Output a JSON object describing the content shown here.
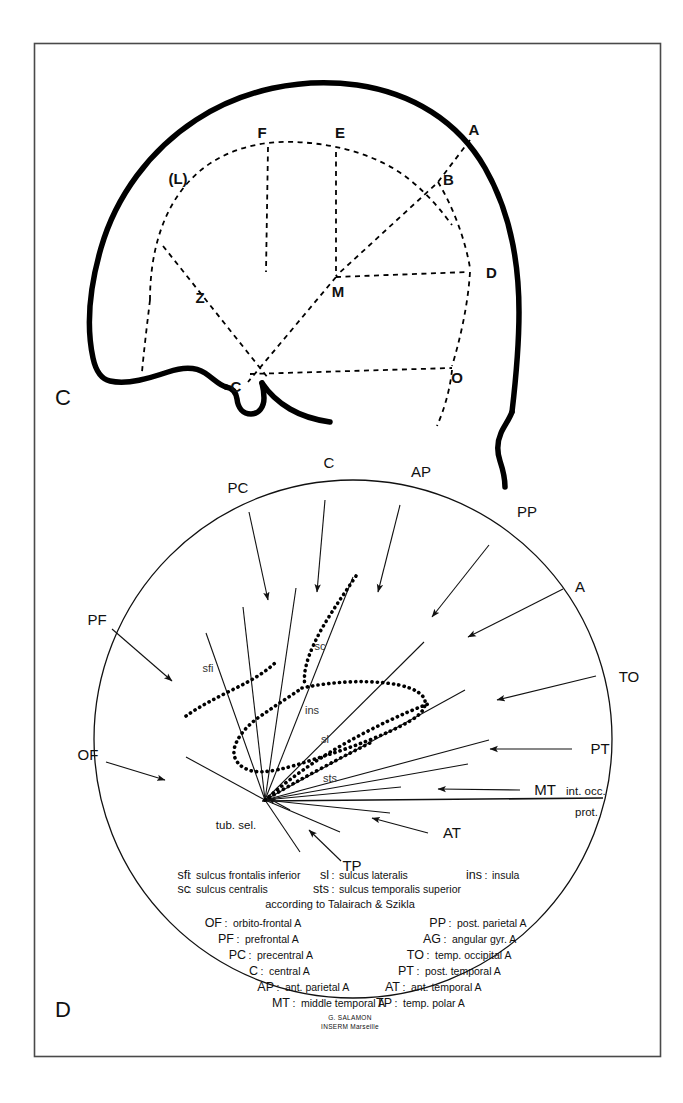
{
  "figure": {
    "panels": [
      {
        "id": "C",
        "label": "C",
        "caption_role": "lateral-skull-landmark-diagram"
      },
      {
        "id": "D",
        "label": "D",
        "caption_role": "circular-angiographic-reference-diagram"
      }
    ]
  },
  "panel_c": {
    "label": "C",
    "points": [
      {
        "name": "F",
        "label": "F"
      },
      {
        "name": "E",
        "label": "E"
      },
      {
        "name": "A",
        "label": "A"
      },
      {
        "name": "B",
        "label": "B"
      },
      {
        "name": "L",
        "label": "(L)"
      },
      {
        "name": "D",
        "label": "D"
      },
      {
        "name": "M",
        "label": "M"
      },
      {
        "name": "Z",
        "label": "Z"
      },
      {
        "name": "C",
        "label": "C"
      },
      {
        "name": "O",
        "label": "O"
      }
    ]
  },
  "panel_d": {
    "label": "D",
    "rim_labels": [
      {
        "name": "PC",
        "label": "PC"
      },
      {
        "name": "C",
        "label": "C"
      },
      {
        "name": "AP",
        "label": "AP"
      },
      {
        "name": "PP",
        "label": "PP"
      },
      {
        "name": "A",
        "label": "A"
      },
      {
        "name": "TO",
        "label": "TO"
      },
      {
        "name": "PT",
        "label": "PT"
      },
      {
        "name": "MT",
        "label": "MT"
      },
      {
        "name": "AT",
        "label": "AT"
      },
      {
        "name": "TP",
        "label": "TP"
      },
      {
        "name": "OF",
        "label": "OF"
      },
      {
        "name": "PF",
        "label": "PF"
      }
    ],
    "inner_labels": [
      {
        "name": "sfi",
        "label": "sfi"
      },
      {
        "name": "sc",
        "label": "sc"
      },
      {
        "name": "ins",
        "label": "ins"
      },
      {
        "name": "sl",
        "label": "sl"
      },
      {
        "name": "sts",
        "label": "sts"
      }
    ],
    "anatomic_markers": [
      {
        "name": "tuberculum-sellae",
        "label": "tub. sel."
      },
      {
        "name": "internal-occipital-protuberance-line1",
        "label": "int. occ."
      },
      {
        "name": "internal-occipital-protuberance-line2",
        "label": "prot."
      }
    ],
    "key": {
      "sulci": [
        {
          "abbr": "sfi",
          "definition": "sulcus frontalis inferior"
        },
        {
          "abbr": "sl",
          "definition": "sulcus lateralis"
        },
        {
          "abbr": "ins",
          "definition": "insula"
        },
        {
          "abbr": "sc",
          "definition": "sulcus centralis"
        },
        {
          "abbr": "sts",
          "definition": "sulcus temporalis superior"
        }
      ],
      "attribution": "according to Talairach & Szikla",
      "arteries_left": [
        {
          "abbr": "OF",
          "definition": "orbito-frontal A"
        },
        {
          "abbr": "PF",
          "definition": "prefrontal A"
        },
        {
          "abbr": "PC",
          "definition": "precentral A"
        },
        {
          "abbr": "C",
          "definition": "central A"
        },
        {
          "abbr": "AP",
          "definition": "ant. parietal A"
        },
        {
          "abbr": "MT",
          "definition": "middle temporal A"
        }
      ],
      "arteries_right": [
        {
          "abbr": "PP",
          "definition": "post. parietal A"
        },
        {
          "abbr": "AG",
          "definition": "angular gyr. A"
        },
        {
          "abbr": "TO",
          "definition": "temp. occipital A"
        },
        {
          "abbr": "PT",
          "definition": "post. temporal A"
        },
        {
          "abbr": "AT",
          "definition": "ant. temporal A"
        },
        {
          "abbr": "TP",
          "definition": "temp. polar A"
        }
      ],
      "credit_line1": "G. SALAMON",
      "credit_line2": "INSERM  Marseille"
    }
  },
  "colors": {
    "ink": "#000000",
    "frame": "#4a4a4a",
    "background": "#ffffff"
  }
}
